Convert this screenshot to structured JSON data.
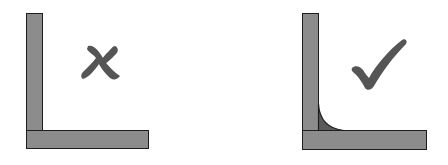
{
  "diagram": {
    "panels": [
      {
        "id": "sharp-corner",
        "mark": "cross",
        "meaning": "incorrect",
        "fillet": false
      },
      {
        "id": "filleted-corner",
        "mark": "check",
        "meaning": "correct",
        "fillet": true
      }
    ],
    "colors": {
      "bar_fill": "#8c8c8c",
      "bar_outline": "#1e1e1e",
      "fillet_fill": "#5a5a5a",
      "mark": "#555555",
      "background": "#ffffff"
    }
  }
}
